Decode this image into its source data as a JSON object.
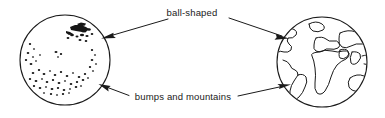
{
  "figure": {
    "background_color": "#ffffff",
    "ink_color": "#1a1a1a",
    "width": 385,
    "height": 118
  },
  "labels": {
    "top": "ball-shaped",
    "bottom": "bumps and mountains"
  },
  "left_object": {
    "name": "speckled ball",
    "center": [
      65,
      60
    ],
    "radius": 45,
    "feature": "scattered dark bumps with dense cluster upper-right and dense band along lower edge"
  },
  "right_object": {
    "name": "earth globe",
    "center": [
      322,
      62
    ],
    "radius": 45,
    "feature": "continent outlines: Americas, Europe, Africa, Asia, Australia"
  },
  "arrows": [
    {
      "id": "top-left",
      "label_ref": "top",
      "from": [
        168,
        19
      ],
      "to": [
        102,
        38
      ],
      "direction": "down-left",
      "points_to": "left_object"
    },
    {
      "id": "top-right",
      "label_ref": "top",
      "from": [
        228,
        18
      ],
      "to": [
        288,
        38
      ],
      "direction": "down-right",
      "points_to": "right_object"
    },
    {
      "id": "bottom-left",
      "label_ref": "bottom",
      "from": [
        128,
        95
      ],
      "to": [
        100,
        85
      ],
      "direction": "up-left",
      "points_to": "left_object"
    },
    {
      "id": "bottom-right",
      "label_ref": "bottom",
      "from": [
        238,
        96
      ],
      "to": [
        290,
        85
      ],
      "direction": "up-right",
      "points_to": "right_object"
    }
  ]
}
